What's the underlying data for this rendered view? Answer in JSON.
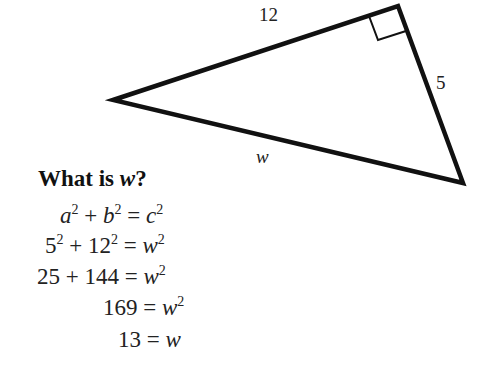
{
  "diagram": {
    "type": "right-triangle",
    "side_labels": {
      "top": "12",
      "right": "5",
      "bottom": "w"
    },
    "right_angle_marker": true,
    "stroke_color": "#111111"
  },
  "question": {
    "prefix": "What is ",
    "var": "w",
    "suffix": "?"
  },
  "steps": [
    {
      "left": "a² + b²",
      "right": "c²"
    },
    {
      "left": "5² + 12²",
      "right": "w²"
    },
    {
      "left": "25 + 144",
      "right": "w²"
    },
    {
      "left": "169",
      "right": "w²"
    },
    {
      "left": "13",
      "right": "w"
    }
  ]
}
